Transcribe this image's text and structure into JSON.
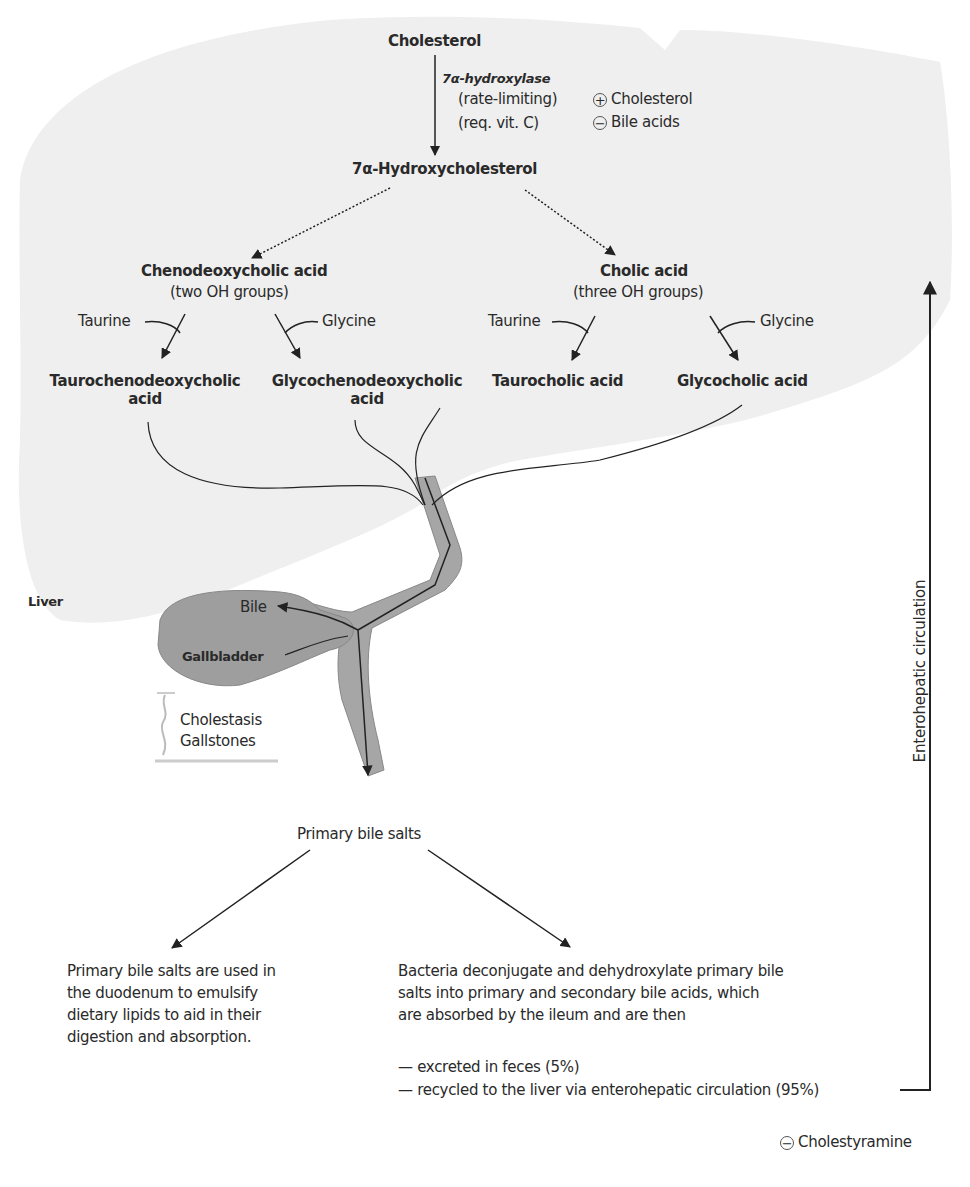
{
  "diagram": {
    "organs": {
      "liver": "Liver",
      "gallbladder": "Gallbladder",
      "bile": "Bile"
    },
    "pathway": {
      "cholesterol": "Cholesterol",
      "enzyme": "7α-hydroxylase",
      "enzyme_note_1": "(rate-limiting)",
      "enzyme_note_2": "(req. vit. C)",
      "regulation_positive": "Cholesterol",
      "regulation_negative": "Bile acids",
      "intermediate": "7α-Hydroxycholesterol",
      "left_acid": "Chenodeoxycholic acid",
      "left_acid_note": "(two OH groups)",
      "right_acid": "Cholic acid",
      "right_acid_note": "(three OH groups)",
      "taurine": "Taurine",
      "glycine": "Glycine",
      "conjugates": [
        {
          "line1": "Taurochenodeoxycholic",
          "line2": "acid"
        },
        {
          "line1": "Glycochenodeoxycholic",
          "line2": "acid"
        },
        {
          "line1": "Taurocholic acid",
          "line2": ""
        },
        {
          "line1": "Glycocholic acid",
          "line2": ""
        }
      ]
    },
    "disorders": {
      "line1": "Cholestasis",
      "line2": "Gallstones"
    },
    "primary_bile_salts": "Primary bile salts",
    "left_outcome": "Primary bile salts are used in\nthe duodenum to emulsify\ndietary lipids to aid in their\ndigestion and absorption.",
    "right_outcome": "Bacteria deconjugate and dehydroxylate primary bile\nsalts into primary and secondary bile acids, which\nare absorbed by the ileum and are then",
    "fates": [
      "— excreted in feces (5%)",
      "— recycled to the liver via enterohepatic circulation (95%)"
    ],
    "enterohepatic_label": "Enterohepatic circulation",
    "inhibitor": "Cholestyramine",
    "symbols": {
      "plus": "+",
      "minus": "−"
    },
    "colors": {
      "liver_fill": "#f0f0f0",
      "duct_fill": "#a6a6a6",
      "gallbladder_fill": "#9e9e9e",
      "line": "#222222"
    }
  }
}
